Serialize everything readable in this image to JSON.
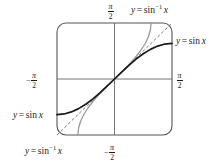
{
  "figure": {
    "name": "sine-and-arcsine-graph",
    "background_color": "#ffffff"
  },
  "labels": {
    "arcsine_top": {
      "lhs": "y",
      "eq": "=",
      "fn": "sin",
      "exp": "−1",
      "var": "x"
    },
    "sine_right": {
      "lhs": "y",
      "eq": "=",
      "fn": "sin",
      "var": "x"
    },
    "sine_left": {
      "lhs": "y",
      "eq": "=",
      "fn": "sin",
      "var": "x"
    },
    "arcsine_bottom": {
      "lhs": "y",
      "eq": "=",
      "fn": "sin",
      "exp": "−1",
      "var": "x"
    }
  },
  "ticks": {
    "top": {
      "sign": "",
      "num": "π",
      "den": "2"
    },
    "bottom": {
      "sign": "−",
      "num": "π",
      "den": "2"
    },
    "left": {
      "sign": "−",
      "num": "π",
      "den": "2"
    },
    "right": {
      "sign": "",
      "num": "π",
      "den": "2"
    }
  },
  "colors": {
    "sine_curve": "#1a1a1a",
    "arcsine_curve": "#9a9a9a",
    "identity_line": "#555555",
    "axis": "#666666",
    "frame": "#555555",
    "text": "#1a1a1a"
  },
  "chart_data": {
    "type": "line",
    "title": "",
    "xlabel": "",
    "ylabel": "",
    "xlim": [
      -1.5707963,
      1.5707963
    ],
    "ylim": [
      -1.5707963,
      1.5707963
    ],
    "grid": false,
    "legend": "inline-annotations",
    "axis_ticks": {
      "x": [
        -1.5707963,
        1.5707963
      ],
      "x_labels": [
        "-π/2",
        "π/2"
      ],
      "y": [
        -1.5707963,
        1.5707963
      ],
      "y_labels": [
        "-π/2",
        "π/2"
      ]
    },
    "series": [
      {
        "name": "y = sin x",
        "style": "solid-dark",
        "color": "#1a1a1a",
        "domain": [
          -1.5707963,
          1.5707963
        ],
        "x": [
          -1.5708,
          -1.3744,
          -1.1781,
          -0.9817,
          -0.7854,
          -0.589,
          -0.3927,
          -0.1963,
          0,
          0.1963,
          0.3927,
          0.589,
          0.7854,
          0.9817,
          1.1781,
          1.3744,
          1.5708
        ],
        "y": [
          -1,
          -0.9808,
          -0.9239,
          -0.8315,
          -0.7071,
          -0.5556,
          -0.3827,
          -0.1951,
          0,
          0.1951,
          0.3827,
          0.5556,
          0.7071,
          0.8315,
          0.9239,
          0.9808,
          1
        ]
      },
      {
        "name": "y = sin^-1 x",
        "style": "solid-gray",
        "color": "#9a9a9a",
        "domain": [
          -1,
          1
        ],
        "x": [
          -1,
          -0.9808,
          -0.9239,
          -0.8315,
          -0.7071,
          -0.5556,
          -0.3827,
          -0.1951,
          0,
          0.1951,
          0.3827,
          0.5556,
          0.7071,
          0.8315,
          0.9239,
          0.9808,
          1
        ],
        "y": [
          -1.5708,
          -1.3744,
          -1.1781,
          -0.9817,
          -0.7854,
          -0.589,
          -0.3927,
          -0.1963,
          0,
          0.1963,
          0.3927,
          0.589,
          0.7854,
          0.9817,
          1.1781,
          1.3744,
          1.5708
        ]
      },
      {
        "name": "y = x",
        "style": "dashed",
        "color": "#555555",
        "domain": [
          -1.5707963,
          1.5707963
        ],
        "x": [
          -1.5707963,
          1.5707963
        ],
        "y": [
          -1.5707963,
          1.5707963
        ]
      }
    ]
  },
  "geometry": {
    "frame": {
      "x": 57,
      "y": 23,
      "width": 115,
      "height": 112,
      "corner_radius": 9
    },
    "origin": {
      "x": 114.5,
      "y": 79
    }
  }
}
